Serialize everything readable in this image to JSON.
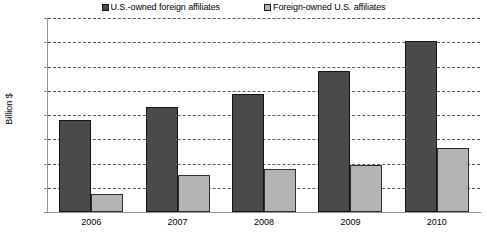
{
  "chart_data": {
    "type": "bar",
    "title": "",
    "xlabel": "",
    "ylabel": "Billion $",
    "categories": [
      "2006",
      "2007",
      "2008",
      "2009",
      "2010"
    ],
    "series": [
      {
        "name": "U.S.-owned foreign affiliates",
        "color": "#4a4a4a",
        "values": [
          1900,
          2170,
          2430,
          2910,
          3530
        ]
      },
      {
        "name": "Foreign-owned U.S. affiliates",
        "color": "#b3b3b3",
        "values": [
          370,
          770,
          880,
          960,
          1320
        ]
      }
    ],
    "ylim": [
      0,
      4000
    ],
    "ytick_step": 500,
    "yticks": [
      0,
      500,
      1000,
      1500,
      2000,
      2500,
      3000,
      3500,
      4000
    ],
    "ytick_labels": [
      "0",
      "500",
      "1000",
      "1500",
      "2000",
      "2500",
      "3000",
      "3500",
      "4000"
    ],
    "grid": "horizontal-dashed",
    "legend_position": "top"
  }
}
